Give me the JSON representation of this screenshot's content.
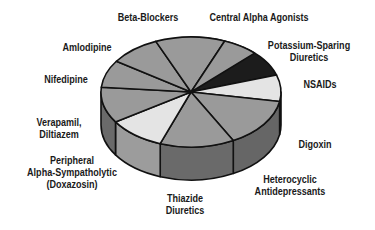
{
  "chart_data": {
    "type": "pie",
    "style": "3d",
    "title": "",
    "slices": [
      {
        "label": "Beta-Blockers",
        "lines": [
          "Beta-Blockers"
        ],
        "value": 9,
        "color": "#9a9a9a",
        "side": "#6e6e6e"
      },
      {
        "label": "Central Alpha Agonists",
        "lines": [
          "Central Alpha Agonists"
        ],
        "value": 9,
        "color": "#9a9a9a",
        "side": "#6e6e6e"
      },
      {
        "label": "Potassium-Sparing Diuretics",
        "lines": [
          "Potassium-Sparing",
          "Diuretics"
        ],
        "value": 9,
        "color": "#1c1c1c",
        "side": "#111111"
      },
      {
        "label": "NSAIDs",
        "lines": [
          "NSAIDs"
        ],
        "value": 9,
        "color": "#e4e4e4",
        "side": "#b8b8b8"
      },
      {
        "label": "Digoxin",
        "lines": [
          "Digoxin"
        ],
        "value": 9,
        "color": "#9a9a9a",
        "side": "#666666"
      },
      {
        "label": "Heterocyclic Antidepressants",
        "lines": [
          "Heterocyclic",
          "Antidepressants"
        ],
        "value": 9,
        "color": "#9a9a9a",
        "side": "#6a6a6a"
      },
      {
        "label": "Thiazide Diuretics",
        "lines": [
          "Thiazide",
          "Diuretics"
        ],
        "value": 9,
        "color": "#e4e4e4",
        "side": "#9c9c9c"
      },
      {
        "label": "Peripheral Alpha-Sympatholytic (Doxazosin)",
        "lines": [
          "Peripheral",
          "Alpha-Sympatholytic",
          "(Doxazosin)"
        ],
        "value": 9,
        "color": "#9a9a9a",
        "side": "#6a6a6a"
      },
      {
        "label": "Verapamil, Diltiazem",
        "lines": [
          "Verapamil,",
          "Diltiazem"
        ],
        "value": 9,
        "color": "#9a9a9a",
        "side": "#6e6e6e"
      },
      {
        "label": "Nifedipine",
        "lines": [
          "Nifedipine"
        ],
        "value": 9,
        "color": "#9a9a9a",
        "side": "#6e6e6e"
      },
      {
        "label": "Amlodipine",
        "lines": [
          "Amlodipine"
        ],
        "value": 9,
        "color": "#9a9a9a",
        "side": "#6e6e6e"
      }
    ],
    "legend": "none",
    "labels_position": "outside"
  },
  "labels": {
    "beta_blockers": "Beta-Blockers",
    "central_alpha": "Central Alpha Agonists",
    "k_sparing_1": "Potassium-Sparing",
    "k_sparing_2": "Diuretics",
    "nsaids": "NSAIDs",
    "digoxin": "Digoxin",
    "heterocyclic_1": "Heterocyclic",
    "heterocyclic_2": "Antidepressants",
    "thiazide_1": "Thiazide",
    "thiazide_2": "Diuretics",
    "peripheral_1": "Peripheral",
    "peripheral_2": "Alpha-Sympatholytic",
    "peripheral_3": "(Doxazosin)",
    "verapamil_1": "Verapamil,",
    "verapamil_2": "Diltiazem",
    "nifedipine": "Nifedipine",
    "amlodipine": "Amlodipine"
  }
}
